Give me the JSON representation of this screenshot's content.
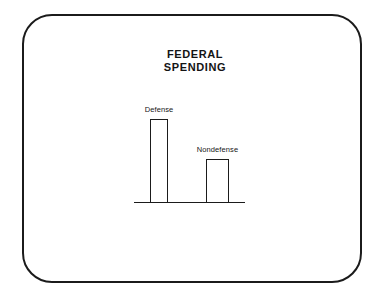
{
  "slide": {
    "frame_shape": "rounded-rectangle",
    "border_color": "#1b1b1b",
    "background_color": "#ffffff"
  },
  "chart_data": {
    "type": "bar",
    "title": "FEDERAL\nSPENDING",
    "title_line1": "FEDERAL",
    "title_line2": "SPENDING",
    "categories": [
      "Defense",
      "Nondefense"
    ],
    "values": [
      84,
      44
    ],
    "value_unit": "relative bar height (px)",
    "xlabel": "",
    "ylabel": "",
    "ylim": [
      0,
      100
    ],
    "grid": false,
    "legend": "none",
    "axis": {
      "baseline_visible": true,
      "y_axis_visible": false,
      "tick_labels": []
    },
    "bar_style": {
      "fill": "#ffffff",
      "outline": "#1b1b1b"
    },
    "labels_position": "above-bar"
  }
}
